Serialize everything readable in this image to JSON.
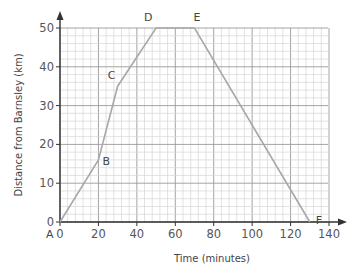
{
  "chart_data": {
    "type": "line",
    "title": "",
    "xlabel": "Time (minutes)",
    "ylabel": "Distance from Barnsley (km)",
    "xlim": [
      0,
      140
    ],
    "ylim": [
      0,
      50
    ],
    "x_ticks": [
      "0",
      "20",
      "40",
      "60",
      "80",
      "100",
      "120",
      "140"
    ],
    "y_ticks": [
      "0",
      "10",
      "20",
      "30",
      "40",
      "50"
    ],
    "grid": true,
    "minor_grid_x_step": 4,
    "minor_grid_y_step": 2,
    "series": [
      {
        "name": "Journey",
        "points": [
          {
            "label": "A",
            "x": 0,
            "y": 0
          },
          {
            "label": "B",
            "x": 20,
            "y": 16
          },
          {
            "label": "C",
            "x": 30,
            "y": 35
          },
          {
            "label": "D",
            "x": 50,
            "y": 50
          },
          {
            "label": "E",
            "x": 70,
            "y": 50
          },
          {
            "label": "F",
            "x": 130,
            "y": 0
          }
        ]
      }
    ],
    "colors": {
      "line": "#a8a8a8",
      "major_grid": "#9a9a9a",
      "minor_grid": "#d6d6d6",
      "axis": "#333333"
    }
  },
  "labels": {
    "x_axis": "Time (minutes)",
    "y_axis": "Distance from Barnsley (km)",
    "origin": "A"
  }
}
